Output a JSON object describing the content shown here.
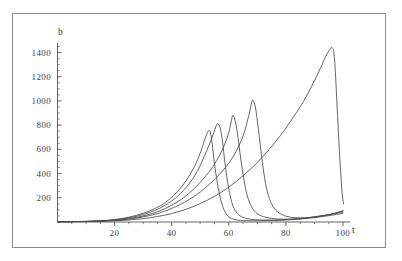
{
  "chart_data": {
    "type": "line",
    "title": "",
    "xlabel": "t",
    "ylabel": "b",
    "xlim": [
      0,
      103
    ],
    "ylim": [
      0,
      1510
    ],
    "grid": false,
    "legend": "none",
    "xticks": [
      20,
      40,
      60,
      80,
      100
    ],
    "yticks": [
      200,
      400,
      600,
      800,
      1000,
      1200,
      1400
    ],
    "xtick_labels": [
      "20",
      "40",
      "60",
      "80",
      "100"
    ],
    "ytick_labels": [
      "200",
      "400",
      "600",
      "800",
      "1000",
      "1200",
      "1400"
    ],
    "line_color": "#4a4a4a",
    "axis_color": "#555555",
    "frame_color": "#8c8c8c",
    "series": [
      {
        "name": "curve-1",
        "peak_t": 53,
        "peak_b": 755,
        "points": [
          [
            0,
            2
          ],
          [
            5,
            3
          ],
          [
            10,
            5
          ],
          [
            15,
            10
          ],
          [
            20,
            20
          ],
          [
            25,
            40
          ],
          [
            30,
            72
          ],
          [
            34,
            110
          ],
          [
            38,
            165
          ],
          [
            42,
            250
          ],
          [
            45,
            340
          ],
          [
            48,
            460
          ],
          [
            50,
            570
          ],
          [
            51,
            640
          ],
          [
            52,
            710
          ],
          [
            53,
            755
          ],
          [
            53.6,
            735
          ],
          [
            54.2,
            640
          ],
          [
            55,
            480
          ],
          [
            56,
            320
          ],
          [
            57,
            200
          ],
          [
            58,
            120
          ],
          [
            59,
            70
          ],
          [
            60,
            42
          ],
          [
            62,
            20
          ],
          [
            65,
            12
          ],
          [
            70,
            10
          ],
          [
            75,
            12
          ],
          [
            80,
            16
          ],
          [
            85,
            24
          ],
          [
            90,
            36
          ],
          [
            95,
            52
          ],
          [
            100,
            72
          ]
        ]
      },
      {
        "name": "curve-2",
        "peak_t": 56,
        "peak_b": 812,
        "points": [
          [
            0,
            2
          ],
          [
            5,
            3
          ],
          [
            10,
            5
          ],
          [
            15,
            9
          ],
          [
            20,
            18
          ],
          [
            25,
            34
          ],
          [
            30,
            62
          ],
          [
            34,
            95
          ],
          [
            38,
            142
          ],
          [
            42,
            212
          ],
          [
            46,
            312
          ],
          [
            49,
            420
          ],
          [
            51,
            520
          ],
          [
            53,
            630
          ],
          [
            54.5,
            720
          ],
          [
            55.5,
            790
          ],
          [
            56.2,
            812
          ],
          [
            57,
            775
          ],
          [
            57.8,
            660
          ],
          [
            58.6,
            500
          ],
          [
            59.5,
            340
          ],
          [
            60.5,
            215
          ],
          [
            61.5,
            130
          ],
          [
            63,
            70
          ],
          [
            65,
            38
          ],
          [
            68,
            22
          ],
          [
            72,
            16
          ],
          [
            76,
            16
          ],
          [
            80,
            20
          ],
          [
            85,
            29
          ],
          [
            90,
            43
          ],
          [
            95,
            60
          ],
          [
            100,
            82
          ]
        ]
      },
      {
        "name": "curve-3",
        "peak_t": 61,
        "peak_b": 880,
        "points": [
          [
            0,
            2
          ],
          [
            5,
            3
          ],
          [
            10,
            4
          ],
          [
            15,
            8
          ],
          [
            20,
            15
          ],
          [
            25,
            28
          ],
          [
            30,
            50
          ],
          [
            35,
            85
          ],
          [
            40,
            138
          ],
          [
            44,
            198
          ],
          [
            48,
            278
          ],
          [
            52,
            382
          ],
          [
            55,
            478
          ],
          [
            58,
            610
          ],
          [
            60,
            740
          ],
          [
            61,
            850
          ],
          [
            61.5,
            880
          ],
          [
            62.3,
            830
          ],
          [
            63.2,
            700
          ],
          [
            64.2,
            520
          ],
          [
            65.3,
            350
          ],
          [
            66.5,
            215
          ],
          [
            68,
            125
          ],
          [
            70,
            68
          ],
          [
            73,
            38
          ],
          [
            77,
            25
          ],
          [
            82,
            24
          ],
          [
            87,
            32
          ],
          [
            92,
            48
          ],
          [
            96,
            64
          ],
          [
            100,
            90
          ]
        ]
      },
      {
        "name": "curve-4",
        "peak_t": 68,
        "peak_b": 1005,
        "points": [
          [
            0,
            2
          ],
          [
            5,
            3
          ],
          [
            10,
            4
          ],
          [
            15,
            7
          ],
          [
            20,
            13
          ],
          [
            25,
            24
          ],
          [
            30,
            42
          ],
          [
            35,
            70
          ],
          [
            40,
            112
          ],
          [
            45,
            170
          ],
          [
            50,
            248
          ],
          [
            55,
            352
          ],
          [
            59,
            455
          ],
          [
            62,
            560
          ],
          [
            65,
            710
          ],
          [
            67,
            880
          ],
          [
            68,
            985
          ],
          [
            68.5,
            1005
          ],
          [
            69.3,
            950
          ],
          [
            70.2,
            800
          ],
          [
            71.2,
            600
          ],
          [
            72.3,
            400
          ],
          [
            73.5,
            250
          ],
          [
            75,
            150
          ],
          [
            77,
            85
          ],
          [
            80,
            48
          ],
          [
            84,
            34
          ],
          [
            89,
            38
          ],
          [
            93,
            52
          ],
          [
            97,
            72
          ],
          [
            100,
            95
          ]
        ]
      },
      {
        "name": "curve-5",
        "peak_t": 96,
        "peak_b": 1440,
        "points": [
          [
            0,
            2
          ],
          [
            5,
            3
          ],
          [
            10,
            4
          ],
          [
            15,
            6
          ],
          [
            20,
            10
          ],
          [
            25,
            17
          ],
          [
            30,
            28
          ],
          [
            35,
            45
          ],
          [
            40,
            70
          ],
          [
            45,
            105
          ],
          [
            50,
            152
          ],
          [
            55,
            212
          ],
          [
            60,
            288
          ],
          [
            65,
            382
          ],
          [
            70,
            492
          ],
          [
            74,
            596
          ],
          [
            78,
            712
          ],
          [
            82,
            845
          ],
          [
            86,
            990
          ],
          [
            89,
            1120
          ],
          [
            92,
            1265
          ],
          [
            94,
            1370
          ],
          [
            95.5,
            1428
          ],
          [
            96.2,
            1440
          ],
          [
            96.9,
            1380
          ],
          [
            97.5,
            1160
          ],
          [
            98.1,
            880
          ],
          [
            98.7,
            600
          ],
          [
            99.3,
            370
          ],
          [
            99.8,
            215
          ],
          [
            100.2,
            150
          ]
        ]
      }
    ]
  },
  "axis_labels": {
    "y_axis_name": "b",
    "x_axis_name": "t"
  }
}
